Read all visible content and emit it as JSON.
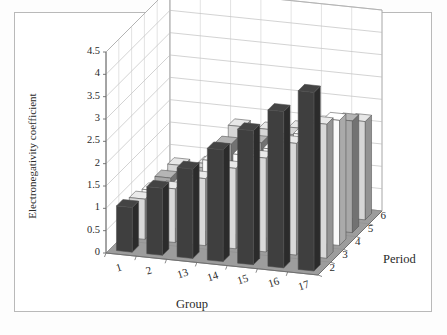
{
  "figure": {
    "background": "#ffffff",
    "frame_color": "#b9b9b9"
  },
  "chart_data": {
    "type": "bar",
    "title": "",
    "subtitle": "",
    "xlabel": "Group",
    "ylabel": "Electronegativity coefficient",
    "zlabel": "Period",
    "projection": "3d",
    "grid": true,
    "legend": "none",
    "categories": [
      "1",
      "2",
      "13",
      "14",
      "15",
      "16",
      "17"
    ],
    "depth_categories": [
      "2",
      "3",
      "4",
      "5",
      "6"
    ],
    "ylim": [
      0,
      4.5
    ],
    "yticks": [
      "0",
      "0.5",
      "1",
      "1.5",
      "2",
      "2.5",
      "3",
      "3.5",
      "4",
      "4.5"
    ],
    "ytick_values": [
      0,
      0.5,
      1,
      1.5,
      2,
      2.5,
      3,
      3.5,
      4,
      4.5
    ],
    "xtick_labels": [
      "1",
      "2",
      "13",
      "14",
      "15",
      "16",
      "17"
    ],
    "ztick_labels": [
      "2",
      "3",
      "4",
      "5",
      "6"
    ],
    "series": [
      {
        "name": "2",
        "color": "#3f3f3f",
        "values": [
          1.0,
          1.5,
          2.0,
          2.5,
          3.0,
          3.5,
          4.0
        ]
      },
      {
        "name": "3",
        "color": "#d9d9d9",
        "values": [
          0.9,
          1.2,
          1.5,
          1.8,
          2.1,
          2.5,
          3.0
        ]
      },
      {
        "name": "4",
        "color": "#fafafa",
        "values": [
          0.8,
          1.0,
          1.6,
          1.8,
          2.0,
          2.4,
          2.8
        ]
      },
      {
        "name": "5",
        "color": "#a8a8a8",
        "values": [
          0.8,
          0.95,
          1.7,
          1.8,
          1.9,
          2.1,
          2.5
        ]
      },
      {
        "name": "6",
        "color": "#d6d6d6",
        "values": [
          0.79,
          0.89,
          1.8,
          1.8,
          1.9,
          2.0,
          2.2
        ]
      }
    ]
  }
}
